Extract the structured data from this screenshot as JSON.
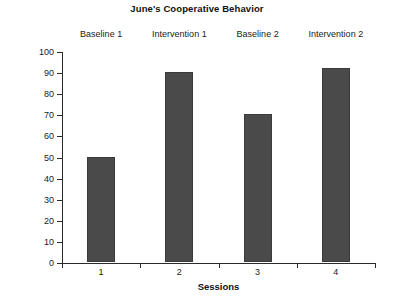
{
  "chart_data": {
    "type": "bar",
    "title": "June's Cooperative Behavior",
    "xlabel": "Sessions",
    "ylabel": "% of Intervals Cooperative",
    "categories": [
      "1",
      "2",
      "3",
      "4"
    ],
    "values": [
      50,
      90,
      70,
      92
    ],
    "ylim": [
      0,
      100
    ],
    "y_ticks": [
      "0",
      "10",
      "20",
      "30",
      "40",
      "50",
      "60",
      "70",
      "80",
      "90",
      "100"
    ],
    "x_ticks": [
      "1",
      "2",
      "3",
      "4"
    ],
    "grid": false,
    "legend": "none",
    "bar_color": "#4a4a4a",
    "axis_color": "#2b2b2b",
    "phase_labels": [
      {
        "label": "Baseline 1",
        "session": "1"
      },
      {
        "label": "Intervention 1",
        "session": "2"
      },
      {
        "label": "Baseline 2",
        "session": "3"
      },
      {
        "label": "Intervention 2",
        "session": "4"
      }
    ]
  }
}
